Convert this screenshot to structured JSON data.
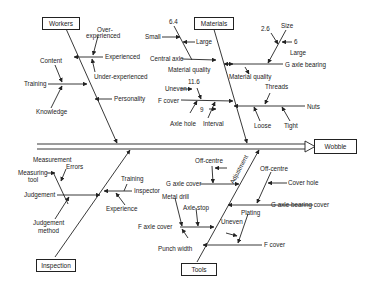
{
  "diagram": {
    "type": "fishbone",
    "effect": "Wobble",
    "categories": {
      "workers": {
        "title": "Workers",
        "causes": {
          "experienced": "Experienced",
          "over_experienced": "Over-\nexperienced",
          "over_line1": "Over-",
          "over_line2": "experienced",
          "under_experienced": "Under-experienced",
          "training": "Training",
          "content": "Content",
          "knowledge": "Knowledge",
          "personality": "Personality"
        }
      },
      "materials": {
        "title": "Materials",
        "causes": {
          "val_6_4": "6.4",
          "small": "Small",
          "large": "Large",
          "central_axle": "Central axle",
          "material_quality_1": "Material quality",
          "material_quality_2": "Material quality",
          "val_2_6": "2.6",
          "size": "Size",
          "val_6": "6",
          "large_2": "Large",
          "g_axle_bearing": "G axle bearing",
          "val_11_6": "11.6",
          "uneven": "Uneven",
          "f_cover": "F cover",
          "axle_hole": "Axle hole",
          "val_9": "9",
          "interval": "Interval",
          "threads": "Threads",
          "nuts": "Nuts",
          "loose": "Loose",
          "tight": "Tight"
        }
      },
      "inspection": {
        "title": "Inspection",
        "causes": {
          "measurement": "Measurement",
          "errors": "Errors",
          "measuring_line1": "Measuring",
          "measuring_line2": "tool",
          "judgement": "Judgement",
          "judgement_method_line1": "Judgement",
          "judgement_method_line2": "method",
          "training": "Training",
          "inspector": "Inspector",
          "experience": "Experience"
        }
      },
      "tools": {
        "title": "Tools",
        "causes": {
          "off_centre_1": "Off-centre",
          "adjustment": "Adjustment",
          "g_axle_cover": "G axle cover",
          "metal_drill": "Metal drill",
          "axle_stop": "Axle stop",
          "f_axle_cover": "F axle cover",
          "punch_width": "Punch width",
          "off_centre_2": "Off-centre",
          "cover_hole": "Cover hole",
          "g_axle_bearing_cover": "G axle bearing cover",
          "plating": "Plating",
          "uneven": "Uneven",
          "f_cover": "F cover"
        }
      }
    }
  }
}
